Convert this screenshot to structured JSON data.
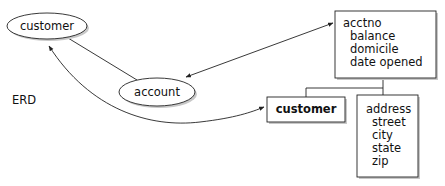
{
  "diagram": {
    "label": "ERD",
    "entities": {
      "customer_ellipse": "customer",
      "account_ellipse": "account"
    },
    "account_box": {
      "lines": [
        "acctno",
        "balance",
        "domicile",
        "date opened"
      ]
    },
    "customer_box": {
      "label": "customer"
    },
    "address_box": {
      "lines": [
        "address",
        "street",
        "city",
        "state",
        "zip"
      ]
    },
    "colors": {
      "stroke": "#222222",
      "shadow": "#b8b8b8",
      "fill": "#ffffff"
    }
  }
}
